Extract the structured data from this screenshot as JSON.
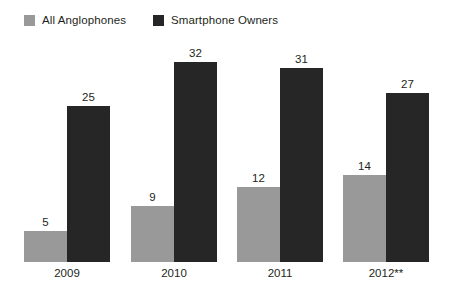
{
  "chart_data": {
    "type": "bar",
    "title": "",
    "subtitle": "",
    "xlabel": "",
    "ylabel": "",
    "grid": false,
    "legend_position": "top-left",
    "axis_visible": false,
    "ylim": [
      0,
      36
    ],
    "categories": [
      "2009",
      "2010",
      "2011",
      "2012**"
    ],
    "series": [
      {
        "name": "All Anglophones",
        "color": "#999999",
        "values": [
          5,
          9,
          12,
          14
        ]
      },
      {
        "name": "Smartphone Owners",
        "color": "#262626",
        "values": [
          25,
          32,
          31,
          27
        ]
      }
    ]
  },
  "legend": {
    "items": [
      {
        "label": "All Anglophones",
        "swatch": "legend-swatch-all-anglophones",
        "color": "#999999"
      },
      {
        "label": "Smartphone Owners",
        "swatch": "legend-swatch-smartphone-owners",
        "color": "#262626"
      }
    ]
  },
  "axis": {
    "categories": [
      "2009",
      "2010",
      "2011",
      "2012**"
    ]
  },
  "labels": {
    "all_anglophones": [
      "5",
      "9",
      "12",
      "14"
    ],
    "smartphone_owners": [
      "25",
      "32",
      "31",
      "27"
    ]
  }
}
